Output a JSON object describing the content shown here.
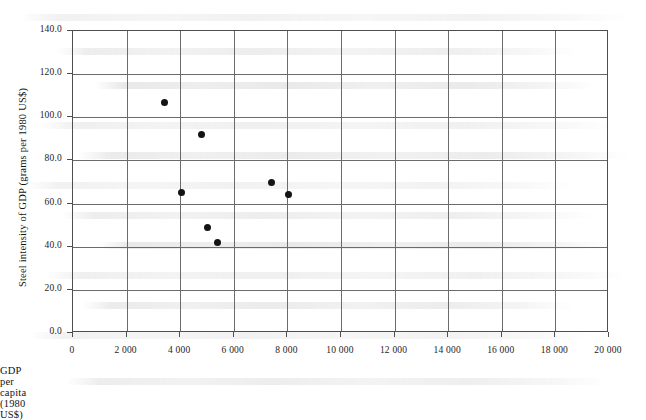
{
  "chart_data": {
    "type": "scatter",
    "title": "",
    "xlabel": "GDP per capita (1980 US$)",
    "ylabel": "Steel intensity of GDP (grams per 1980 US$)",
    "xlim": [
      0,
      20000
    ],
    "ylim": [
      0,
      140
    ],
    "grid": true,
    "legend": "none",
    "xticks": [
      0,
      2000,
      4000,
      6000,
      8000,
      10000,
      12000,
      14000,
      16000,
      18000,
      20000
    ],
    "xticklabels": [
      "0",
      "2 000",
      "4 000",
      "6 000",
      "8 000",
      "10 000",
      "12 000",
      "14 000",
      "16 000",
      "18 000",
      "20 000"
    ],
    "yticks": [
      0,
      20,
      40,
      60,
      80,
      100,
      120,
      140
    ],
    "yticklabels": [
      "0.0",
      "20.0",
      "40.0",
      "60.0",
      "80.0",
      "100.0",
      "120.0",
      "140.0"
    ],
    "series": [
      {
        "name": "Steel intensity",
        "marker": "filled-circle",
        "color": "#141414",
        "points": [
          {
            "x": 3400,
            "y": 107
          },
          {
            "x": 4800,
            "y": 92
          },
          {
            "x": 4050,
            "y": 65
          },
          {
            "x": 5000,
            "y": 49
          },
          {
            "x": 5400,
            "y": 42
          },
          {
            "x": 7400,
            "y": 70
          },
          {
            "x": 8050,
            "y": 64
          }
        ]
      }
    ]
  },
  "style": {
    "frame_color": "#4f4f4f",
    "grid_color": "#6b6b6b",
    "background": "#ffffff",
    "marker_color": "#141414"
  },
  "artifacts": {
    "note": "faint scanned bleed-through text rows",
    "rows": [
      14,
      48,
      82,
      122,
      152,
      182,
      212,
      242,
      272,
      302,
      332,
      378
    ]
  }
}
